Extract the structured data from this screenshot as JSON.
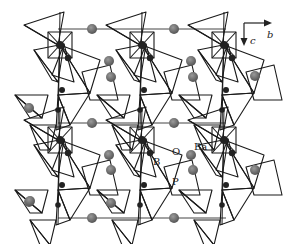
{
  "figure": {
    "background": "#ffffff",
    "line_color": "#1a1a1a",
    "atom_color_ba": "#555555",
    "atom_color_p": "#222222"
  },
  "axes": {
    "horizontal": {
      "label": "b"
    },
    "vertical": {
      "label": "c"
    }
  },
  "labels": {
    "boron": "B",
    "oxygen": "O",
    "phosphorus": "P",
    "barium": "Ba"
  },
  "legend_atoms": [
    "Ba",
    "B",
    "O",
    "P"
  ],
  "unit_cell": {
    "x1": 58,
    "y1": 29,
    "x2": 226,
    "y2": 218
  },
  "chain_offsets_x": [
    0,
    82,
    164
  ],
  "chain_offsets_y": [
    0,
    95
  ],
  "ba_atoms": [
    {
      "x": 92,
      "y": 29
    },
    {
      "x": 174,
      "y": 29
    },
    {
      "x": 109,
      "y": 61
    },
    {
      "x": 191,
      "y": 61
    },
    {
      "x": 92,
      "y": 123
    },
    {
      "x": 174,
      "y": 123
    },
    {
      "x": 109,
      "y": 155
    },
    {
      "x": 191,
      "y": 155
    },
    {
      "x": 92,
      "y": 218
    },
    {
      "x": 174,
      "y": 218
    },
    {
      "x": 29,
      "y": 108
    },
    {
      "x": 111,
      "y": 77
    },
    {
      "x": 193,
      "y": 77
    },
    {
      "x": 111,
      "y": 170
    },
    {
      "x": 193,
      "y": 170
    },
    {
      "x": 29,
      "y": 202
    },
    {
      "x": 111,
      "y": 203
    },
    {
      "x": 30,
      "y": 201
    },
    {
      "x": 255,
      "y": 76
    },
    {
      "x": 255,
      "y": 170
    }
  ]
}
